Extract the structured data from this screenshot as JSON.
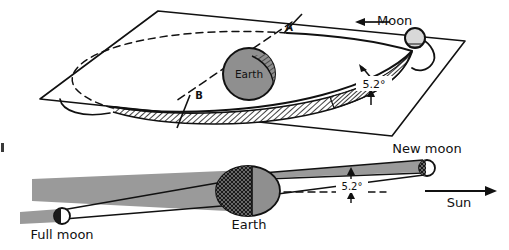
{
  "figure": {
    "background_color": "#ffffff",
    "ink_color": "#111111",
    "shadow_gray": "#9a9a9a",
    "earth_gray": "#8f8f8f",
    "moon_gray": "#d8d8d8",
    "night_dark": "#1a1a1a"
  },
  "top_panel": {
    "name": "orbit-plane-perspective",
    "labels": {
      "moon": "Moon",
      "earth": "Earth",
      "node_ascending": "A",
      "node_descending": "B",
      "inclination": "5.2°"
    },
    "elements": {
      "ecliptic_plane": "ecliptic-plane-parallelogram",
      "orbit_ellipse": "moon-orbit-ellipse",
      "orbit_hidden_arc": "moon-orbit-dashed-arc",
      "node_line": "line-of-nodes-dashed",
      "tilt_wedge": "hatched-inclination-wedge",
      "direction_arrow": "moon-direction-arrow-left"
    }
  },
  "bottom_panel": {
    "name": "shadow-cone-side-view",
    "labels": {
      "full_moon": "Full moon",
      "new_moon": "New moon",
      "earth": "Earth",
      "sun": "Sun",
      "inclination": "5.2°"
    },
    "elements": {
      "earth_shadow_cone": "earth-umbra-cone",
      "moon_shadow_full": "full-moon-shadow-cone",
      "moon_shadow_new": "new-moon-shadow-cone",
      "reference_line": "ecliptic-reference-dashed-line",
      "sun_arrow": "sun-direction-arrow-right"
    }
  }
}
